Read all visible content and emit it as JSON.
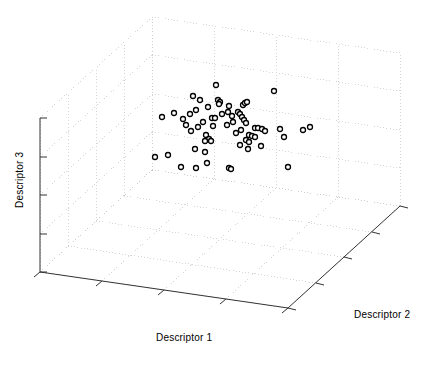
{
  "figure": {
    "type": "3d-scatter-plot",
    "background_color": "#ffffff",
    "axis_color": "#333333",
    "grid_color": "#cccccc",
    "marker_edge_color": "#000000",
    "marker_face_color": "#ffffff"
  },
  "labels": {
    "x_axis": "Descriptor 1",
    "y_axis": "Descriptor 2",
    "z_axis": "Descriptor 3"
  },
  "chart_data": {
    "type": "scatter",
    "title": "",
    "xlabel": "Descriptor 1",
    "ylabel": "Descriptor 2",
    "zlabel": "Descriptor 3",
    "projection": "3d",
    "grid": true,
    "legend": null,
    "xlim": [
      0,
      1
    ],
    "ylim": [
      0,
      1
    ],
    "zlim": [
      0,
      1
    ],
    "xticks": [
      0,
      0.25,
      0.5,
      0.75,
      1
    ],
    "yticks": [
      0,
      0.25,
      0.5,
      0.75,
      1
    ],
    "zticks": [
      0,
      0.25,
      0.5,
      0.75,
      1
    ],
    "tick_labels_shown": false,
    "marker": "circle-open",
    "marker_size": 5,
    "n_points": 62,
    "points_px": [
      [
        216,
        85
      ],
      [
        274,
        91
      ],
      [
        218,
        100
      ],
      [
        220,
        102
      ],
      [
        219,
        104
      ],
      [
        193,
        96
      ],
      [
        200,
        100
      ],
      [
        243,
        105
      ],
      [
        229,
        106
      ],
      [
        245,
        103
      ],
      [
        247,
        102
      ],
      [
        162,
        117
      ],
      [
        174,
        113
      ],
      [
        183,
        119
      ],
      [
        190,
        114
      ],
      [
        196,
        110
      ],
      [
        208,
        107
      ],
      [
        228,
        112
      ],
      [
        212,
        118
      ],
      [
        215,
        118
      ],
      [
        222,
        114
      ],
      [
        232,
        116
      ],
      [
        238,
        112
      ],
      [
        240,
        114
      ],
      [
        242,
        117
      ],
      [
        244,
        120
      ],
      [
        246,
        123
      ],
      [
        233,
        122
      ],
      [
        227,
        125
      ],
      [
        213,
        126
      ],
      [
        203,
        122
      ],
      [
        198,
        127
      ],
      [
        191,
        131
      ],
      [
        186,
        125
      ],
      [
        206,
        135
      ],
      [
        209,
        139
      ],
      [
        211,
        141
      ],
      [
        205,
        141
      ],
      [
        255,
        128
      ],
      [
        258,
        128
      ],
      [
        262,
        129
      ],
      [
        249,
        135
      ],
      [
        252,
        136
      ],
      [
        255,
        137
      ],
      [
        241,
        130
      ],
      [
        236,
        133
      ],
      [
        246,
        140
      ],
      [
        249,
        142
      ],
      [
        265,
        131
      ],
      [
        280,
        129
      ],
      [
        284,
        137
      ],
      [
        303,
        130
      ],
      [
        261,
        146
      ],
      [
        248,
        149
      ],
      [
        240,
        145
      ],
      [
        195,
        149
      ],
      [
        205,
        152
      ],
      [
        155,
        157
      ],
      [
        168,
        155
      ],
      [
        181,
        167
      ],
      [
        196,
        168
      ],
      [
        207,
        163
      ],
      [
        229,
        168
      ],
      [
        231,
        169
      ],
      [
        288,
        167
      ],
      [
        310,
        127
      ]
    ],
    "data_description": "Dense central cluster of open-circle markers occupying the middle of a 3D box, denser toward the upper-middle region."
  },
  "geometry": {
    "origin_px": [
      40,
      272
    ],
    "x_axis_end_px": [
      288,
      308
    ],
    "y_axis_end_px": [
      400,
      210
    ],
    "z_axis_top_px": [
      40,
      118
    ],
    "box_back_top_px": [
      152,
      17
    ],
    "x_ticks_count": 5,
    "y_ticks_count": 5,
    "z_ticks_count": 5
  }
}
